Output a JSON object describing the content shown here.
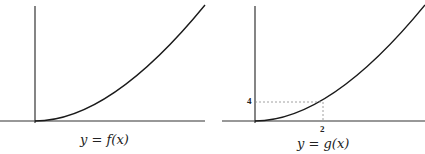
{
  "panels": [
    {
      "caption": "y = f(x)",
      "curve": "increasing concave-up curve from origin"
    },
    {
      "caption": "y = g(x)",
      "curve": "increasing concave-up curve from origin",
      "marked_point": {
        "x_label": "2",
        "y_label": "4"
      }
    }
  ],
  "colors": {
    "axis": "#333333",
    "curve": "#1a1a1a",
    "guide": "#888888"
  }
}
